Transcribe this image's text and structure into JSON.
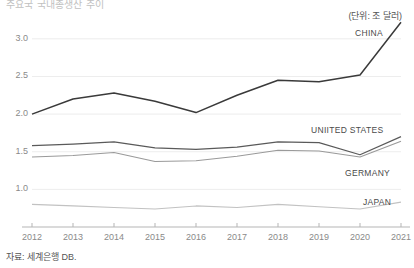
{
  "header": {
    "title": "주요국 국내총생산 추이",
    "unit_note": "(단위: 조 달러)"
  },
  "footer": {
    "source_note": "자료: 세계은행 DB."
  },
  "series_labels": {
    "china": "CHINA",
    "united_states": "UNIITED STATES",
    "germany": "GERMANY",
    "japan": "JAPAN"
  },
  "axis": {
    "y_ticks": [
      "1.0",
      "1.5",
      "2.0",
      "2.5",
      "3.0"
    ],
    "x_ticks": [
      "2012",
      "2013",
      "2014",
      "2015",
      "2016",
      "2017",
      "2018",
      "2019",
      "2020",
      "2021"
    ]
  },
  "colors": {
    "china_line": "#3a3a3a",
    "united_states_line": "#5a5a5a",
    "germany_line": "#9a9a9a",
    "japan_line": "#c2c2c2",
    "grid": "#ededed",
    "axis": "#b5b5b5",
    "text": "#4a4a4a",
    "tick_text": "#8a8a8a"
  },
  "chart_data": {
    "type": "line",
    "title": "주요국 국내총생산 추이",
    "subtitle": "(단위: 조 달러)",
    "xlabel": "",
    "ylabel": "",
    "unit": "조 달러",
    "grid": true,
    "legend_position": "inline-right",
    "x": [
      2012,
      2013,
      2014,
      2015,
      2016,
      2017,
      2018,
      2019,
      2020,
      2021
    ],
    "ylim": [
      0.5,
      3.25
    ],
    "xlim": [
      2012,
      2021
    ],
    "yticks": [
      1.0,
      1.5,
      2.0,
      2.5,
      3.0
    ],
    "series": [
      {
        "name": "CHINA",
        "values": [
          2.0,
          2.2,
          2.28,
          2.17,
          2.02,
          2.25,
          2.45,
          2.43,
          2.52,
          3.22
        ]
      },
      {
        "name": "UNIITED STATES",
        "values": [
          1.58,
          1.6,
          1.63,
          1.55,
          1.53,
          1.56,
          1.63,
          1.62,
          1.46,
          1.7
        ]
      },
      {
        "name": "GERMANY",
        "values": [
          1.43,
          1.45,
          1.49,
          1.37,
          1.38,
          1.44,
          1.52,
          1.51,
          1.43,
          1.64
        ]
      },
      {
        "name": "JAPAN",
        "values": [
          0.8,
          0.78,
          0.76,
          0.74,
          0.78,
          0.76,
          0.8,
          0.77,
          0.74,
          0.83
        ]
      }
    ]
  }
}
